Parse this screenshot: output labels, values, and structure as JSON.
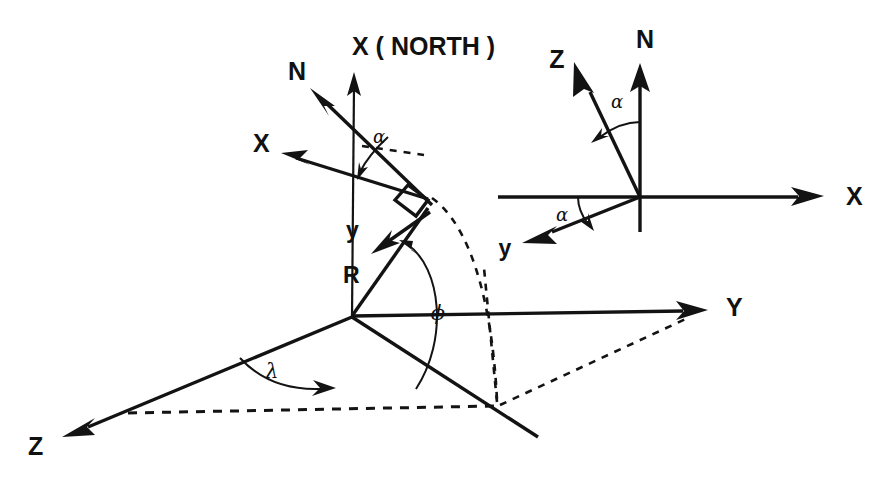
{
  "figure": {
    "background_color": "#ffffff",
    "ink_color": "#131313",
    "width": 891,
    "height": 481
  },
  "main_diagram": {
    "name": "main-coordinate-frame",
    "axis_labels": {
      "x_north": "X ( NORTH )",
      "y": "Y",
      "z": "Z"
    },
    "vector_labels": {
      "n": "N",
      "x_local": "X",
      "y_local": "y",
      "r": "R"
    },
    "angle_labels": {
      "alpha": "α",
      "phi": "ϕ",
      "lambda": "λ"
    }
  },
  "inset_diagram": {
    "name": "inset-local-frame",
    "axis_labels": {
      "n": "N",
      "x": "X",
      "z": "Z",
      "y": "y"
    },
    "angle_labels": {
      "alpha_upper": "α",
      "alpha_lower": "α"
    }
  }
}
